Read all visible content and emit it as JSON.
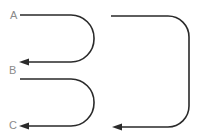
{
  "diagram": {
    "labels": {
      "a": "A",
      "b": "B",
      "c": "C"
    },
    "paths": [
      {
        "id": "loop-a-to-b",
        "from": "A",
        "to": "B"
      },
      {
        "id": "loop-b-to-c",
        "from": "B",
        "to": "C"
      },
      {
        "id": "loop-large",
        "from": "top",
        "to": "bottom"
      }
    ],
    "colors": {
      "stroke": "#2a2a2a",
      "label": "#8a8a8a"
    }
  }
}
